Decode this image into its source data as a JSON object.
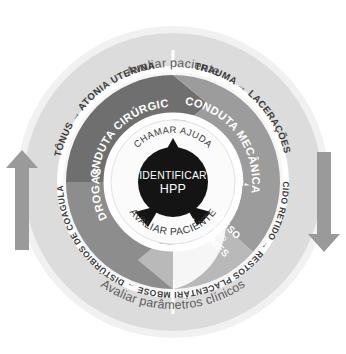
{
  "diagram": {
    "center": {
      "line1": "IDENTIFICAR",
      "line2": "HPP"
    },
    "inner_ring": {
      "top_label": "CHAMAR AJUDA",
      "bottom_label": "AVALIAR PACIENTE"
    },
    "middle_ring": [
      {
        "label": "CONDUTA CIRÚRGICA",
        "color": "#6e6e6e",
        "position": "top-left"
      },
      {
        "label": "CONDUTA MECÂNICA",
        "color": "#9b9b9b",
        "position": "right"
      },
      {
        "label": "ACESSO Venoso + EXAMES",
        "line1": "ACESSO",
        "line2": "Venoso",
        "line3": "+ EXAMES",
        "color": "#b4b4b4",
        "position": "bottom-right"
      },
      {
        "label": "DROGAS",
        "color": "#8c8c8c",
        "position": "left"
      }
    ],
    "outer_ring": [
      {
        "cause": "TÔNUS",
        "arrow": "→",
        "effect": "ATONIA UTERINA",
        "position": "top-left"
      },
      {
        "cause": "TRAUMA",
        "arrow": "→",
        "effect": "LACERAÇÕES",
        "position": "top-right"
      },
      {
        "cause": "TECIDO RETIDO",
        "arrow": "→",
        "effect": "RESTOS PLACENTÁRIOS",
        "position": "bottom-right"
      },
      {
        "cause": "TROMBOSE",
        "arrow": "→",
        "effect": "DISTÚRBIOS DE COAGULAÇÃO",
        "position": "bottom-left"
      }
    ],
    "captions": {
      "top": "Avaliar paciente",
      "bottom": "Avaliar parâmetros clínicos"
    },
    "side_arrows": {
      "left": "up-arrow",
      "right": "down-arrow"
    },
    "colors": {
      "background": "#ffffff",
      "halo": "#f0f0f0",
      "outer_ring": "#d9d9d9",
      "center_circle": "#111111",
      "white_gap": "#ffffff",
      "side_arrow": "#9a9a9a",
      "caption_text": "#5a5a5a",
      "outer_text": "#3a3a3a"
    }
  }
}
